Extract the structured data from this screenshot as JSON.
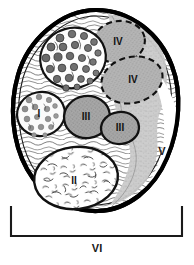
{
  "figure": {
    "kind": "histology-cross-section-diagram",
    "background_color": "#ffffff",
    "outline_color": "#000000",
    "colors": {
      "outer_sheath": "#000000",
      "light_fascicle_fill": "#fcfcfc",
      "mid_gray_fill": "#b8b8b8",
      "dark_gray_fill": "#9a9a9a",
      "stipple_gray": "#c9c9c9",
      "axon_dot": "#6e6e6e",
      "label_color": "#111111"
    }
  },
  "labels": [
    {
      "id": "label-I",
      "text": "I",
      "x": 39,
      "y": 114,
      "size": 10,
      "inside": true
    },
    {
      "id": "label-II",
      "text": "II",
      "x": 74,
      "y": 181,
      "size": 10,
      "inside": true
    },
    {
      "id": "label-III-upper",
      "text": "III",
      "x": 86,
      "y": 117,
      "size": 10,
      "inside": true
    },
    {
      "id": "label-III-lower",
      "text": "III",
      "x": 120,
      "y": 128,
      "size": 10,
      "inside": true
    },
    {
      "id": "label-IV-upper",
      "text": "IV",
      "x": 118,
      "y": 41,
      "size": 10,
      "inside": true
    },
    {
      "id": "label-IV-lower",
      "text": "IV",
      "x": 133,
      "y": 79,
      "size": 10,
      "inside": true
    },
    {
      "id": "label-V",
      "text": "V",
      "x": 162,
      "y": 152,
      "size": 11,
      "inside": false
    },
    {
      "id": "label-VI",
      "text": "VI",
      "x": 97,
      "y": 249,
      "size": 11,
      "inside": false
    }
  ],
  "bracket": {
    "id": "bracket-VI",
    "label": "VI",
    "left_x": 11,
    "right_x": 182,
    "baseline_y": 236,
    "tick_top_y": 207,
    "stroke": "#1a1a1a",
    "stroke_width": 2
  },
  "regions": [
    {
      "id": "region-epineurium",
      "name": "outer-sheath",
      "label": "",
      "fill": "#ffffff",
      "stroke": "#000000",
      "stroke_width": 4,
      "stroke_style": "solid",
      "texture": "wavy-fibrous"
    },
    {
      "id": "region-large-axon-group",
      "name": "upper-left-fascicle",
      "label": "",
      "fill": "#fdfdfd",
      "stroke": "#111111",
      "stroke_width": 2,
      "stroke_style": "solid",
      "texture": "large-dark-dots"
    },
    {
      "id": "region-I",
      "name": "fascicle-I",
      "label": "I",
      "fill": "#fafafa",
      "stroke": "#111111",
      "stroke_width": 2,
      "stroke_style": "solid",
      "texture": "medium-gray-dots"
    },
    {
      "id": "region-II",
      "name": "fascicle-II",
      "label": "II",
      "fill": "#ffffff",
      "stroke": "#111111",
      "stroke_width": 2,
      "stroke_style": "solid",
      "texture": "fine-squiggles"
    },
    {
      "id": "region-III-upper",
      "name": "fascicle-III-upper",
      "label": "III",
      "fill": "#adadad",
      "stroke": "#111111",
      "stroke_width": 2,
      "stroke_style": "solid",
      "texture": "stipple"
    },
    {
      "id": "region-III-lower",
      "name": "fascicle-III-lower",
      "label": "III",
      "fill": "#adadad",
      "stroke": "#111111",
      "stroke_width": 2,
      "stroke_style": "solid",
      "texture": "stipple"
    },
    {
      "id": "region-IV-upper",
      "name": "fascicle-IV-upper",
      "label": "IV",
      "fill": "#bcbcbc",
      "stroke": "#111111",
      "stroke_width": 2,
      "stroke_style": "dashed",
      "texture": "stipple"
    },
    {
      "id": "region-IV-lower",
      "name": "fascicle-IV-lower",
      "label": "IV",
      "fill": "#bcbcbc",
      "stroke": "#111111",
      "stroke_width": 2,
      "stroke_style": "dashed",
      "texture": "stipple"
    },
    {
      "id": "region-V",
      "name": "region-V-exterior",
      "label": "V",
      "fill": "#ffffff",
      "stroke": "none",
      "stroke_width": 0,
      "stroke_style": "none",
      "texture": "none"
    },
    {
      "id": "region-VI",
      "name": "region-VI-span",
      "label": "VI",
      "fill": "none",
      "stroke": "#1a1a1a",
      "stroke_width": 2,
      "stroke_style": "solid",
      "texture": "none"
    }
  ]
}
